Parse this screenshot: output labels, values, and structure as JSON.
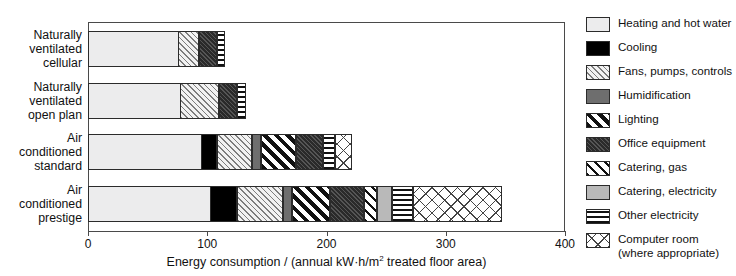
{
  "chart_data": {
    "type": "bar",
    "orientation": "horizontal",
    "stacked": true,
    "title": "",
    "xlabel": "Energy consumption / (annual kW·h/m² treated floor area)",
    "ylabel": "",
    "xlim": [
      0,
      400
    ],
    "xticks": [
      "0",
      "100",
      "200",
      "300",
      "400"
    ],
    "grid": false,
    "legend_position": "right",
    "categories": [
      "Naturally ventilated cellular",
      "Naturally ventilated open plan",
      "Air conditioned standard",
      "Air conditioned prestige"
    ],
    "category_label_lines": [
      [
        "Naturally",
        "ventilated",
        "cellular"
      ],
      [
        "Naturally",
        "ventilated",
        "open plan"
      ],
      [
        "Air",
        "conditioned",
        "standard"
      ],
      [
        "Air",
        "conditioned",
        "prestige"
      ]
    ],
    "series": [
      {
        "name": "Heating and hot water",
        "pattern": "p-heating",
        "values": [
          76,
          78,
          96,
          103
        ]
      },
      {
        "name": "Cooling",
        "pattern": "p-cooling",
        "values": [
          0,
          0,
          13,
          23
        ]
      },
      {
        "name": "Fans, pumps, controls",
        "pattern": "p-fans",
        "values": [
          18,
          33,
          29,
          38
        ]
      },
      {
        "name": "Humidification",
        "pattern": "p-humid",
        "values": [
          0,
          0,
          8,
          8
        ]
      },
      {
        "name": "Lighting",
        "pattern": "p-lighting",
        "values": [
          0,
          0,
          29,
          32
        ]
      },
      {
        "name": "Office equipment",
        "pattern": "p-office",
        "values": [
          15,
          15,
          23,
          28
        ]
      },
      {
        "name": "Catering, gas",
        "pattern": "p-catgas",
        "values": [
          0,
          0,
          0,
          11
        ]
      },
      {
        "name": "Catering, electricity",
        "pattern": "p-catelec",
        "values": [
          0,
          0,
          0,
          13
        ]
      },
      {
        "name": "Other electricity",
        "pattern": "p-otherelec",
        "values": [
          7,
          7,
          10,
          17
        ]
      },
      {
        "name": "Computer room (where appropriate)",
        "pattern": "p-computer",
        "values": [
          0,
          0,
          14,
          75
        ]
      }
    ],
    "totals": [
      116,
      133,
      222,
      348
    ]
  },
  "legend": {
    "items": [
      {
        "label": "Heating and hot water",
        "pattern": "p-heating"
      },
      {
        "label": "Cooling",
        "pattern": "p-cooling"
      },
      {
        "label": "Fans, pumps, controls",
        "pattern": "p-fans"
      },
      {
        "label": "Humidification",
        "pattern": "p-humid"
      },
      {
        "label": "Lighting",
        "pattern": "p-lighting"
      },
      {
        "label": "Office equipment",
        "pattern": "p-office"
      },
      {
        "label": "Catering, gas",
        "pattern": "p-catgas"
      },
      {
        "label": "Catering, electricity",
        "pattern": "p-catelec"
      },
      {
        "label": "Other electricity",
        "pattern": "p-otherelec"
      },
      {
        "label": "Computer room\n(where appropriate)",
        "pattern": "p-computer"
      }
    ]
  },
  "axis": {
    "x_title_prefix": "Energy consumption / (annual kW·h/m",
    "x_title_sup": "2",
    "x_title_suffix": " treated floor area)"
  }
}
